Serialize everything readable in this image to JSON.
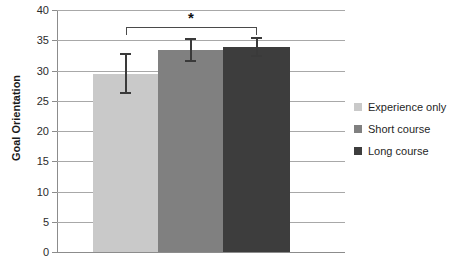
{
  "chart_data": {
    "type": "bar",
    "title": "",
    "xlabel": "",
    "ylabel": "Goal Orientation",
    "ylim": [
      0,
      40
    ],
    "ytick_interval": 5,
    "yticks": [
      "40",
      "35",
      "30",
      "25",
      "20",
      "15",
      "10",
      "5",
      "0"
    ],
    "grid": true,
    "legend_position": "right",
    "categories": [
      "Experience only",
      "Short course",
      "Long course"
    ],
    "values": [
      29.5,
      33.4,
      33.9
    ],
    "errors": [
      3.4,
      2.0,
      1.7
    ],
    "series": [
      {
        "name": "Goal Orientation",
        "values": [
          29.5,
          33.4,
          33.9
        ],
        "errors": [
          3.4,
          2.0,
          1.7
        ]
      }
    ],
    "bar_colors": [
      "#c9c9c9",
      "#808080",
      "#3d3d3d"
    ],
    "annotations": [
      {
        "type": "significance-bracket",
        "label": "*",
        "from_category": "Experience only",
        "to_category": "Long course"
      }
    ]
  },
  "axis": {
    "y_title": "Goal Orientation",
    "ticks": [
      {
        "label": "40",
        "value": 40
      },
      {
        "label": "35",
        "value": 35
      },
      {
        "label": "30",
        "value": 30
      },
      {
        "label": "25",
        "value": 25
      },
      {
        "label": "20",
        "value": 20
      },
      {
        "label": "15",
        "value": 15
      },
      {
        "label": "10",
        "value": 10
      },
      {
        "label": "5",
        "value": 5
      },
      {
        "label": "0",
        "value": 0
      }
    ]
  },
  "legend": {
    "items": [
      {
        "label": "Experience only",
        "color": "#c9c9c9"
      },
      {
        "label": "Short course",
        "color": "#808080"
      },
      {
        "label": "Long course",
        "color": "#3d3d3d"
      }
    ]
  },
  "significance": {
    "marker": "*"
  }
}
